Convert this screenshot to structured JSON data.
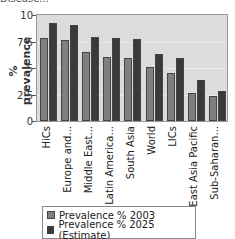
{
  "header": {
    "cut_text": "Disease..."
  },
  "chart_data": {
    "type": "bar",
    "title": "",
    "xlabel": "",
    "ylabel": "% prevalence",
    "ylim": [
      0,
      10
    ],
    "yticks": [
      "0",
      "2.5",
      "5",
      "7.5",
      "10"
    ],
    "grid": true,
    "legend_position": "bottom",
    "categories": [
      "HiCs",
      "Europe and...",
      "Middle East...",
      "Latin America...",
      "South Asia",
      "World",
      "LICs",
      "East Asia Pacific",
      "Sub-Saharan..."
    ],
    "series": [
      {
        "name": "Prevalence % 2003",
        "color": "#7f7f7f",
        "values": [
          7.8,
          7.6,
          6.5,
          6.0,
          5.95,
          5.1,
          4.5,
          2.65,
          2.4
        ]
      },
      {
        "name": "Prevalence % 2025 (Estimate)",
        "color": "#3a3a3a",
        "values": [
          9.2,
          9.05,
          7.9,
          7.85,
          7.7,
          6.3,
          5.95,
          3.9,
          2.85
        ]
      }
    ]
  }
}
